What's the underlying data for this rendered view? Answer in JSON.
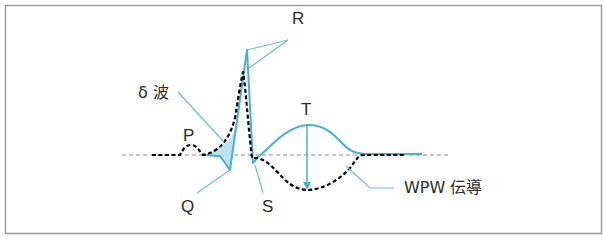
{
  "figure": {
    "title": "",
    "colors": {
      "frame": "#9a9a9a",
      "baseline": "#8a8a8a",
      "normal_trace": "#000000",
      "wpw_trace": "#4aaed6",
      "delta_fill": "#bfe2f3",
      "leader": "#6cbcde",
      "text": "#2b2b2b"
    },
    "labels": {
      "r": "R",
      "delta_wave": "δ 波",
      "p": "P",
      "t": "T",
      "q": "Q",
      "s": "S",
      "wpw": "WPW 伝導"
    },
    "legend": {
      "dashed_black": "normal conduction",
      "solid_blue": "WPW 伝導"
    }
  }
}
